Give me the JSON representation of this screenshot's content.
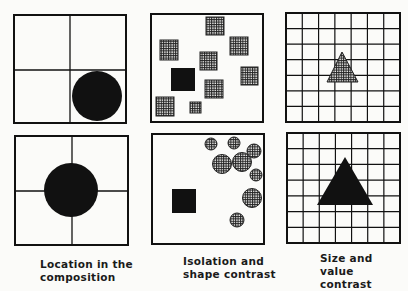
{
  "figure": {
    "panels": [
      {
        "id": "location-top",
        "grid": 2,
        "shape": "circle",
        "fill": "solid",
        "placement": "bottom-right cell"
      },
      {
        "id": "isolation-top",
        "grid": 0,
        "shapes": "squares",
        "odd_one": "solid square",
        "others": "hatched squares",
        "count_hatched": 9
      },
      {
        "id": "size-top",
        "grid": 7,
        "shape": "triangle",
        "fill": "hatched",
        "size": "small"
      },
      {
        "id": "location-bottom",
        "grid": 2,
        "shape": "circle",
        "fill": "solid",
        "placement": "center"
      },
      {
        "id": "isolation-bottom",
        "grid": 0,
        "shapes": "circles",
        "odd_one": "solid square",
        "others": "hatched circles",
        "count_hatched": 9
      },
      {
        "id": "size-bottom",
        "grid": 7,
        "shape": "triangle",
        "fill": "solid",
        "size": "large"
      }
    ],
    "captions": [
      {
        "line1": "Location in the",
        "line2": "composition"
      },
      {
        "line1": "Isolation and",
        "line2": "shape contrast"
      },
      {
        "line1": "Size and",
        "line2": "value contrast"
      }
    ],
    "colors": {
      "ink": "#111111",
      "paper": "#fbfbf9"
    }
  }
}
